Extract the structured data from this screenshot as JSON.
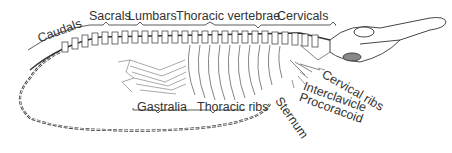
{
  "diagram": {
    "colors": {
      "ink": "#333333",
      "background": "#ffffff"
    },
    "labels": {
      "caudals": "Caudals",
      "sacrals": "Sacrals",
      "lumbars": "Lumbars",
      "thoracic_vertebrae": "Thoracic vertebrae",
      "cervicals": "Cervicals",
      "gastralia": "Gastralia",
      "thoracic_ribs": "Thoracic ribs",
      "cervical_ribs": "Cervical ribs",
      "interclavicle": "Interclavicle",
      "procoracoid": "Procoracoid",
      "sternum": "Sternum"
    }
  }
}
